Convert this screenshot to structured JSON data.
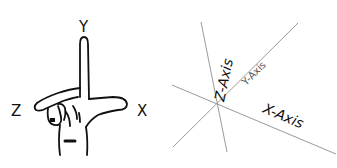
{
  "left_panel": {
    "title": "Hand coordinate rule",
    "labels": {
      "y": "Y",
      "z": "Z",
      "x": "X"
    }
  },
  "right_panel": {
    "title": "3D axes",
    "labels": {
      "z_axis": "Z-Axis",
      "y_axis": "Y-Axis",
      "x_axis": "X-Axis"
    },
    "colors": {
      "axis_line": "#9a9a9a",
      "label_dark": "#111111",
      "label_light": "#555555"
    }
  }
}
